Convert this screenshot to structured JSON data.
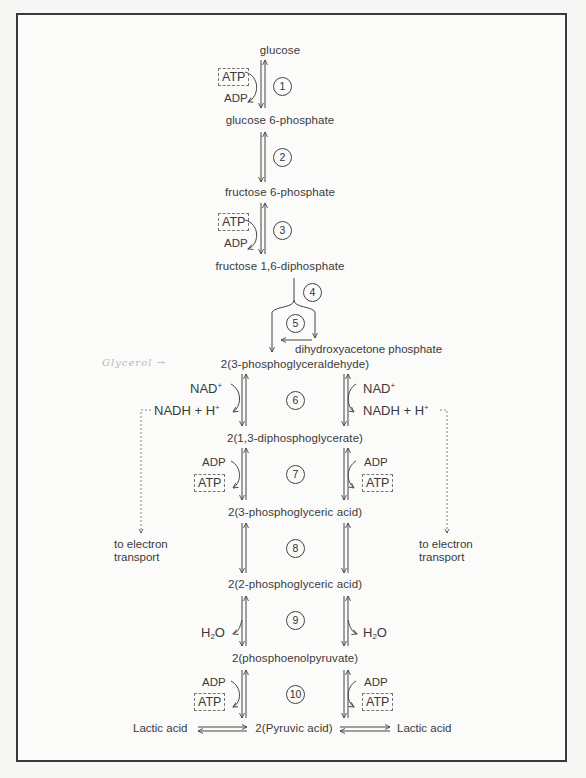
{
  "diagram": {
    "metabolites": {
      "glucose": "glucose",
      "g6p": "glucose 6-phosphate",
      "f6p": "fructose 6-phosphate",
      "f16dp": "fructose 1,6-diphosphate",
      "dhap": "dihydroxyacetone phosphate",
      "pgal": "2(3-phosphoglyceraldehyde)",
      "dpg": "2(1,3-diphosphoglycerate)",
      "pga3": "2(3-phosphoglyceric acid)",
      "pga2": "2(2-phosphoglyceric acid)",
      "pep": "2(phosphoenolpyruvate)",
      "pyruvate": "2(Pyruvic acid)",
      "lactate_left": "Lactic acid",
      "lactate_right": "Lactic acid"
    },
    "steps": [
      "1",
      "2",
      "3",
      "4",
      "5",
      "6",
      "7",
      "8",
      "9",
      "10"
    ],
    "cofactors": {
      "atp": "ATP",
      "adp": "ADP",
      "nad": "NAD",
      "nad_sup": "+",
      "nadh": "NADH + H",
      "nadh_sup": "+",
      "h2o_h": "H",
      "h2o_sub": "2",
      "h2o_o": "O"
    },
    "side_notes": {
      "electron_transport_line1": "to electron",
      "electron_transport_line2": "transport"
    },
    "handwritten_annotation": "Glycerol →"
  }
}
